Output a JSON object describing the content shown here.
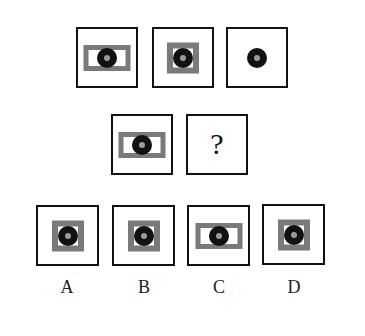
{
  "puzzle": {
    "row1": [
      {
        "id": "fig1",
        "rect": "wide"
      },
      {
        "id": "fig2",
        "rect": "narrow"
      },
      {
        "id": "fig3",
        "rect": "none"
      }
    ],
    "row2": [
      {
        "id": "fig4",
        "rect": "wide"
      },
      {
        "id": "fig5",
        "question_mark": "?"
      }
    ],
    "options": [
      {
        "label": "A",
        "rect": "narrow"
      },
      {
        "label": "B",
        "rect": "narrow"
      },
      {
        "label": "C",
        "rect": "wide"
      },
      {
        "label": "D",
        "rect": "narrow"
      }
    ]
  },
  "colors": {
    "border": "#111111",
    "rect": "#7a7a7a",
    "dot": "#111111",
    "dot_center": "#9a9a9a"
  }
}
